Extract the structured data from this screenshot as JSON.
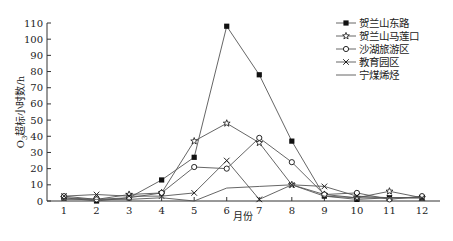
{
  "chart_data": {
    "type": "line",
    "title": "",
    "xlabel": "月份",
    "ylabel": "O3超标小时数/h",
    "ylabel_main": "O",
    "ylabel_sub": "3",
    "ylabel_rest": "超标小时数/h",
    "x": [
      1,
      2,
      3,
      4,
      5,
      6,
      7,
      8,
      9,
      10,
      11,
      12
    ],
    "x_tick_labels": [
      "1",
      "2",
      "3",
      "4",
      "5",
      "6",
      "7",
      "8",
      "9",
      "10",
      "11",
      "12"
    ],
    "y_ticks": [
      0,
      10,
      20,
      30,
      40,
      50,
      60,
      70,
      80,
      90,
      100,
      110
    ],
    "ylim": [
      0,
      110
    ],
    "grid": false,
    "legend_position": "upper-right",
    "series": [
      {
        "name": "贺兰山东路",
        "marker": "filled-square",
        "values": [
          2,
          0,
          2,
          13,
          27,
          108,
          78,
          37,
          3,
          1,
          2,
          2
        ]
      },
      {
        "name": "贺兰山马莲口",
        "marker": "star",
        "values": [
          2,
          1,
          4,
          5,
          37,
          48,
          36,
          10,
          4,
          2,
          6,
          2
        ]
      },
      {
        "name": "沙湖旅游区",
        "marker": "open-circle",
        "values": [
          3,
          1,
          2,
          5,
          21,
          20,
          39,
          24,
          4,
          5,
          1,
          3
        ]
      },
      {
        "name": "教育园区",
        "marker": "x",
        "values": [
          3,
          4,
          3,
          3,
          5,
          25,
          1,
          10,
          9,
          3,
          2,
          2
        ]
      },
      {
        "name": "宁煤烯烃",
        "marker": "none",
        "values": [
          1,
          1,
          1,
          2,
          0,
          8,
          9,
          10,
          3,
          2,
          2,
          2
        ]
      }
    ],
    "colors": {
      "line": "#555555",
      "marker": "#111111",
      "axis": "#333333"
    }
  }
}
